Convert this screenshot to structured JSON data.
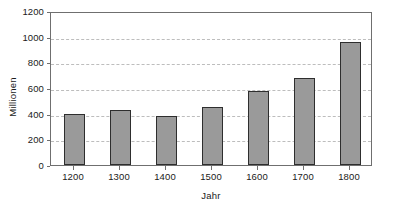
{
  "chart_data": {
    "type": "bar",
    "title": "",
    "subtitle": "",
    "xlabel": "Jahr",
    "ylabel": "Millionen",
    "categories": [
      "1200",
      "1300",
      "1400",
      "1500",
      "1600",
      "1700",
      "1800"
    ],
    "values": [
      400,
      430,
      380,
      450,
      580,
      680,
      955
    ],
    "ylim": [
      0,
      1200
    ],
    "y_ticks": [
      0,
      200,
      400,
      600,
      800,
      1000,
      1200
    ],
    "y_tick_labels": [
      "0",
      "200",
      "400",
      "600",
      "800",
      "1000",
      "1200"
    ],
    "grid": true,
    "grid_axis": "y",
    "grid_style": "dashed",
    "legend": false,
    "legend_position": "none",
    "series": [
      {
        "name": "Bevölkerung",
        "values": [
          400,
          430,
          380,
          450,
          580,
          680,
          955
        ]
      }
    ]
  },
  "style": {
    "bar_fill": "#9a9a9a",
    "bar_border": "#2e2e2e",
    "grid_color": "#bdbdbd",
    "axis_color": "#6f6f6f",
    "text_color": "#1a1a1a",
    "background": "#ffffff"
  }
}
